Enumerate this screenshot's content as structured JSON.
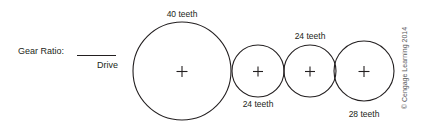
{
  "figure": {
    "type": "gear-train-diagram",
    "background_color": "#ffffff",
    "line_color": "#231f20",
    "prompt_label": "Gear Ratio:",
    "blank_answer_line": "",
    "drive_label": "Drive",
    "copyright": "© Cengage Learning 2014"
  },
  "gears": [
    {
      "id": "gear-1",
      "label": "40 teeth",
      "teeth": 40,
      "role": "drive",
      "label_position": "above",
      "cx": 182,
      "cy": 71,
      "r": 49
    },
    {
      "id": "gear-2",
      "label": "24 teeth",
      "teeth": 24,
      "role": "idler",
      "label_position": "below",
      "cx": 258,
      "cy": 71,
      "r": 26
    },
    {
      "id": "gear-3",
      "label": "24 teeth",
      "teeth": 24,
      "role": "idler",
      "label_position": "above",
      "cx": 310,
      "cy": 71,
      "r": 26
    },
    {
      "id": "gear-4",
      "label": "28 teeth",
      "teeth": 28,
      "role": "driven",
      "label_position": "below",
      "cx": 364,
      "cy": 71,
      "r": 30
    }
  ]
}
